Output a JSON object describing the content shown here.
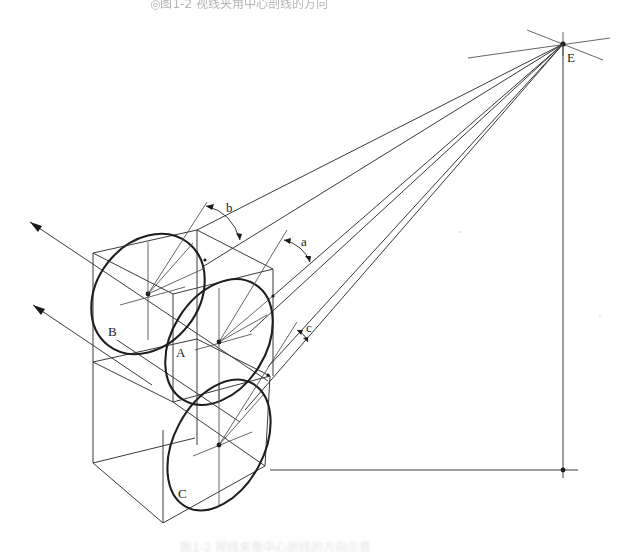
{
  "figure": {
    "caption_top": "◎图1-2 视线夹角中心剖线的方向",
    "caption_bottom": "图1-2 视线夹角中心剖线的方向示意",
    "labels": {
      "eye_point": "E",
      "ellipse_a": "A",
      "ellipse_b": "B",
      "ellipse_c": "C",
      "angle_a": "a",
      "angle_b": "b",
      "angle_c": "c"
    },
    "colors": {
      "line": "#3a3a3a",
      "ellipse": "#1e1e1e",
      "background": "#ffffff"
    }
  }
}
